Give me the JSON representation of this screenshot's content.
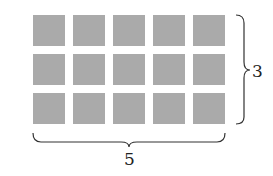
{
  "diagram": {
    "rows": 3,
    "columns": 5,
    "cell_color": "#aaaaaa",
    "row_label": "3",
    "column_label": "5"
  }
}
